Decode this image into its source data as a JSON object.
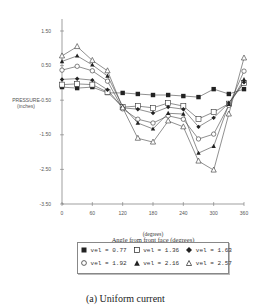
{
  "chart_data": {
    "type": "line",
    "title": "",
    "xlabel": "Angle from front face (degrees)",
    "xunit_label": "(degrees)",
    "ylabel": "PRESSURE",
    "ylabel_unit": "(inches)",
    "x_ticks": [
      0,
      60,
      120,
      180,
      240,
      300,
      360
    ],
    "y_ticks": [
      "1.50",
      "0.50",
      "-0.50",
      "-1.50",
      "-2.50",
      "-3.50"
    ],
    "xlim": [
      0,
      360
    ],
    "ylim": [
      -3.5,
      1.5
    ],
    "grid": false,
    "legend_position": "bottom",
    "x": [
      0,
      30,
      60,
      90,
      120,
      150,
      180,
      210,
      240,
      270,
      300,
      330,
      360
    ],
    "series": [
      {
        "name": "vel = 0.77",
        "marker": "filled-square",
        "values": [
          -0.12,
          -0.15,
          -0.12,
          -0.29,
          -0.29,
          -0.32,
          -0.35,
          -0.35,
          -0.38,
          -0.41,
          -0.18,
          -0.32,
          -0.18
        ]
      },
      {
        "name": "vel = 1.36",
        "marker": "open-square",
        "values": [
          -0.05,
          -0.03,
          -0.05,
          -0.27,
          -0.7,
          -0.67,
          -0.72,
          -0.58,
          -0.67,
          -1.04,
          -0.84,
          -0.6,
          0.0
        ]
      },
      {
        "name": "vel = 1.63",
        "marker": "filled-diamond",
        "values": [
          0.1,
          0.12,
          0.08,
          -0.2,
          -0.72,
          -0.76,
          -0.87,
          -0.7,
          -0.76,
          -1.27,
          -1.01,
          -0.58,
          0.02
        ]
      },
      {
        "name": "vel = 1.92",
        "marker": "open-circle",
        "values": [
          0.37,
          0.48,
          0.35,
          0.05,
          -0.75,
          -1.05,
          -1.16,
          -0.95,
          -1.05,
          -1.62,
          -1.48,
          -0.65,
          0.34
        ]
      },
      {
        "name": "vel = 2.16",
        "marker": "filled-triangle",
        "values": [
          0.62,
          0.78,
          0.52,
          0.2,
          -0.68,
          -1.16,
          -1.33,
          -0.88,
          -0.9,
          -2.03,
          -1.83,
          -0.62,
          0.1
        ]
      },
      {
        "name": "vel = 2.57",
        "marker": "open-triangle",
        "values": [
          0.78,
          1.05,
          0.65,
          0.35,
          -0.72,
          -1.6,
          -1.71,
          -1.1,
          -1.27,
          -2.26,
          -2.52,
          -0.9,
          0.72
        ]
      }
    ]
  },
  "legend": {
    "row1": [
      "vel = 0.77",
      "vel = 1.36",
      "vel = 1.63"
    ],
    "row2": [
      "vel = 1.92",
      "vel = 2.16",
      "vel = 2.57"
    ]
  },
  "caption": "(a) Uniform current"
}
